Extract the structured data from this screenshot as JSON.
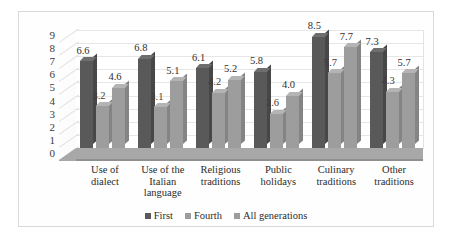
{
  "chart_data": {
    "type": "bar",
    "title": "",
    "xlabel": "",
    "ylabel": "",
    "ylim": [
      0,
      9
    ],
    "yticks": [
      "0",
      "1",
      "2",
      "3",
      "4",
      "5",
      "6",
      "7",
      "8",
      "9"
    ],
    "grid": true,
    "legend_position": "bottom",
    "categories": [
      "Use of dialect",
      "Use of the Italian language",
      "Religious traditions",
      "Public holidays",
      "Culinary traditions",
      "Other traditions"
    ],
    "category_lines": [
      [
        "Use of",
        "dialect"
      ],
      [
        "Use of the",
        "Italian",
        "language"
      ],
      [
        "Religious",
        "traditions"
      ],
      [
        "Public",
        "holidays"
      ],
      [
        "Culinary",
        "traditions"
      ],
      [
        "Other",
        "traditions"
      ]
    ],
    "series": [
      {
        "name": "First",
        "color": "#595959",
        "values": [
          6.6,
          6.8,
          6.1,
          5.8,
          8.5,
          7.3
        ],
        "labels": [
          "6.6",
          "6.8",
          "6.1",
          "5.8",
          "8.5",
          "7.3"
        ]
      },
      {
        "name": "Fourth",
        "color": "#9d9d9d",
        "values": [
          3.2,
          3.1,
          4.2,
          2.6,
          5.7,
          4.3
        ],
        "labels": [
          "3.2",
          "3.1",
          "4.2",
          "2.6",
          "5.7",
          "4.3"
        ]
      },
      {
        "name": "All generations",
        "color": "#9d9d9d",
        "values": [
          4.6,
          5.1,
          5.2,
          4.0,
          7.7,
          5.7
        ],
        "labels": [
          "4.6",
          "5.1",
          "5.2",
          "4.0",
          "7.7",
          "5.7"
        ]
      }
    ]
  }
}
